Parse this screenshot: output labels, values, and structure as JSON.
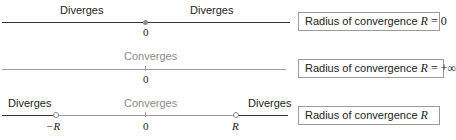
{
  "colors": {
    "axis_dark": "#333333",
    "axis_gray": "#9a9a9a",
    "converge_text": "#8a8a8a",
    "text": "#222222",
    "box_border": "#9a9a9a"
  },
  "rows": [
    {
      "id": "case-r-zero",
      "labels": {
        "left_diverges": "Diverges",
        "right_diverges": "Diverges"
      },
      "ticks": {
        "origin": "0"
      },
      "box": {
        "prefix": "Radius of convergence ",
        "var": "R",
        "rel": " = 0"
      }
    },
    {
      "id": "case-r-infinite",
      "labels": {
        "converges": "Converges"
      },
      "ticks": {
        "origin": "0"
      },
      "box": {
        "prefix": "Radius of convergence ",
        "var": "R",
        "rel": " = +∞"
      }
    },
    {
      "id": "case-r-finite",
      "labels": {
        "left_diverges": "Diverges",
        "converges": "Converges",
        "right_diverges": "Diverges"
      },
      "ticks": {
        "neg_r": "−R",
        "origin": "0",
        "pos_r": "R"
      },
      "box": {
        "prefix": "Radius of convergence ",
        "var": "R",
        "rel": ""
      }
    }
  ]
}
